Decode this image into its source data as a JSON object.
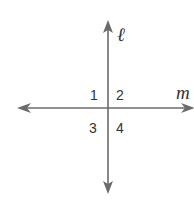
{
  "diagram": {
    "type": "perpendicular lines",
    "lines": [
      {
        "name": "ℓ",
        "orientation": "vertical"
      },
      {
        "name": "m",
        "orientation": "horizontal"
      }
    ],
    "angles": [
      "1",
      "2",
      "3",
      "4"
    ],
    "line_color": "#6b6b6b",
    "text_color": "#333333"
  }
}
